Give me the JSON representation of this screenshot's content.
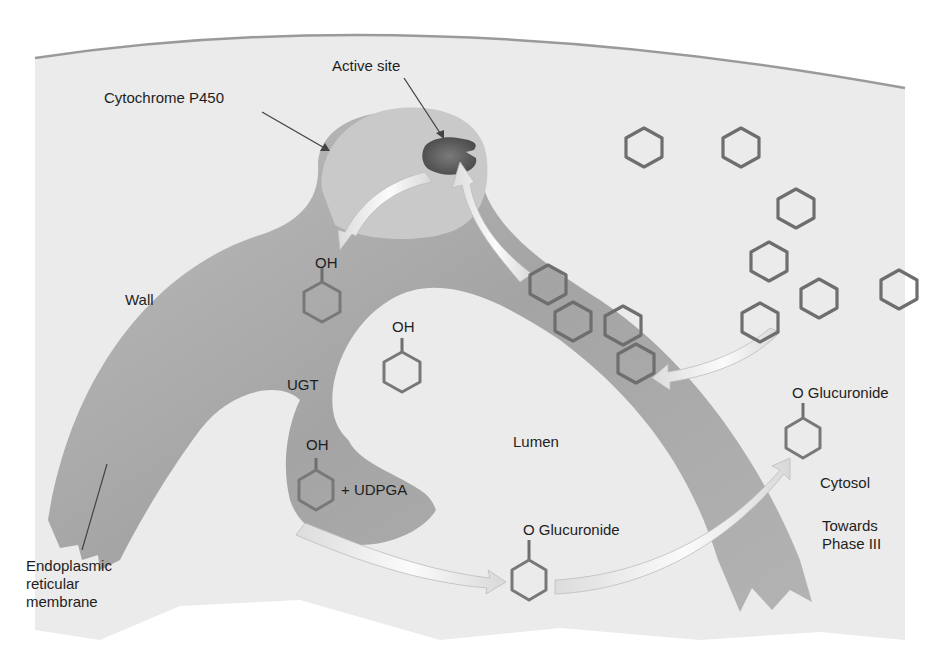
{
  "figure": {
    "colors": {
      "background": "#ffffff",
      "cell_field": "#ebebeb",
      "membrane_wall": "#a9a9a9",
      "cyp450_lobe": "#c9c9c9",
      "active_site": "#4d4d4d",
      "arrow_fill": "#efefef",
      "ring_stroke": "#6e6e6e",
      "text": "#1e1e1e"
    },
    "labels": {
      "active_site": "Active site",
      "cytochrome": "Cytochrome P450",
      "wall": "Wall",
      "ugt": "UGT",
      "lumen": "Lumen",
      "cytosol": "Cytosol",
      "towards_phase": "Towards\nPhase III",
      "er_membrane": "Endoplasmic\nreticular\nmembrane",
      "oh_1": "OH",
      "oh_2": "OH",
      "oh_3": "OH",
      "udpga": "+ UDPGA",
      "glucuronide_lumen": "O Glucuronide",
      "glucuronide_cytosol": "O Glucuronide"
    },
    "nodes": [
      {
        "id": "substrate",
        "label": "Benzene ring (substrate)",
        "count_cytosol": 8,
        "count_in_membrane": 4
      },
      {
        "id": "cyp450",
        "label": "Cytochrome P450"
      },
      {
        "id": "active_site",
        "label": "Active site"
      },
      {
        "id": "phenol",
        "label": "OH-ring (phenol)"
      },
      {
        "id": "ugt",
        "label": "UGT"
      },
      {
        "id": "udpga",
        "label": "+ UDPGA"
      },
      {
        "id": "glucuronide",
        "label": "O Glucuronide"
      }
    ],
    "edges": [
      {
        "from": "substrate",
        "to": "active_site",
        "label": "enters membrane"
      },
      {
        "from": "active_site",
        "to": "phenol",
        "label": "hydroxylation"
      },
      {
        "from": "phenol",
        "to": "glucuronide",
        "label": "UGT + UDPGA"
      },
      {
        "from": "glucuronide",
        "to": "cytosol",
        "label": "Towards Phase III"
      }
    ]
  }
}
